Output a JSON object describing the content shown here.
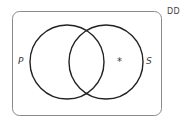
{
  "diagram": {
    "type": "venn",
    "universe_label": "DD",
    "sets": [
      {
        "name": "P",
        "cx": 67,
        "cy": 62,
        "r": 37
      },
      {
        "name": "S",
        "cx": 106,
        "cy": 62,
        "r": 37
      }
    ],
    "marker": {
      "symbol": "*",
      "region": "S only"
    },
    "colors": {
      "circle_stroke": "#222222",
      "box_stroke": "#8a8a8a",
      "text": "#3a3a3a"
    }
  }
}
